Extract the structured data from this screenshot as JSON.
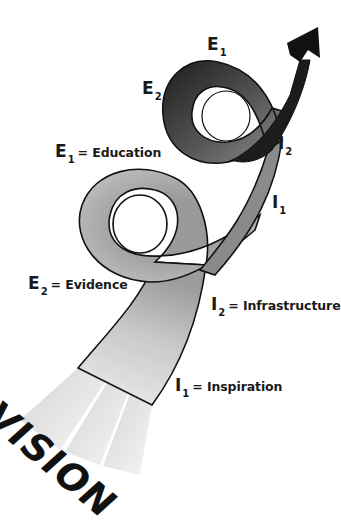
{
  "diagram": {
    "type": "spiral-arrow",
    "base_label": "VISION",
    "loop_labels": {
      "upper_loop": {
        "e1": {
          "letter": "E",
          "sub": "1"
        },
        "e2": {
          "letter": "E",
          "sub": "2"
        },
        "i2": {
          "letter": "I",
          "sub": "2"
        },
        "i1": {
          "letter": "I",
          "sub": "1"
        }
      }
    },
    "legend": [
      {
        "letter": "E",
        "sub": "1",
        "text": "= Education"
      },
      {
        "letter": "E",
        "sub": "2",
        "text": "= Evidence"
      },
      {
        "letter": "I",
        "sub": "2",
        "text": "= Infrastructure"
      },
      {
        "letter": "I",
        "sub": "1",
        "text": "= Inspiration"
      }
    ],
    "colors": {
      "ribbon_light": "#e4e4e4",
      "ribbon_mid": "#a8a8a8",
      "ribbon_dark": "#1c1c1c",
      "outline": "#111111",
      "text": "#1a1a1a"
    }
  }
}
